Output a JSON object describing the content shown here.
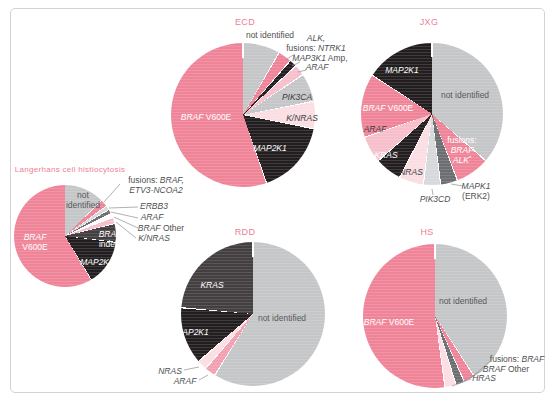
{
  "figure": {
    "background": "#ffffff",
    "frame_color": "#d2d3d5"
  },
  "palette": {
    "pink": "#ef8499",
    "black": "#221e1f",
    "charcoal": "#433e3f",
    "midgray": "#6d6e71",
    "gray": "#c5c6c8",
    "lightgray": "#d7d8da",
    "lightpink": "#f2a0b2",
    "softpink": "#f6bfcb",
    "palepink": "#fadee4",
    "white": "#fcfbfb"
  },
  "chart_data": [
    {
      "id": "lch",
      "type": "pie",
      "title": "Langerhans cell histiocytosis",
      "cx": 65,
      "cy": 236,
      "r": 51,
      "slices": [
        {
          "name": "not identified",
          "deg": 46,
          "pct": 12.8,
          "color": "gray",
          "label": {
            "placement": "inside",
            "x": 83,
            "y": 200,
            "color": "#58595b",
            "lines": [
              [
                {
                  "t": "not",
                  "i": false
                }
              ],
              [
                {
                  "t": "identified",
                  "i": false
                }
              ]
            ]
          }
        },
        {
          "name": "fusions: BRAF, ETV3-NCOA2",
          "deg": 8,
          "pct": 2.2,
          "color": "pink",
          "label": {
            "placement": "outside",
            "x": 156,
            "y": 185,
            "color": "#4f5052",
            "lines": [
              [
                {
                  "t": "fusions: ",
                  "i": false
                },
                {
                  "t": "BRAF,",
                  "i": true
                }
              ],
              [
                {
                  "t": "ETV3-NCOA2",
                  "i": true
                }
              ]
            ]
          }
        },
        {
          "name": "ERBB3",
          "deg": 5,
          "pct": 1.4,
          "color": "lightgray",
          "label": {
            "placement": "outside",
            "x": 154,
            "y": 206,
            "color": "#4f5052",
            "lines": [
              [
                {
                  "t": "ERBB3",
                  "i": true
                }
              ]
            ]
          }
        },
        {
          "name": "ARAF",
          "deg": 5,
          "pct": 1.4,
          "color": "midgray",
          "label": {
            "placement": "outside",
            "x": 152,
            "y": 217,
            "color": "#4f5052",
            "lines": [
              [
                {
                  "t": "ARAF",
                  "i": true
                }
              ]
            ]
          }
        },
        {
          "name": "BRAF Other",
          "deg": 5,
          "pct": 1.4,
          "color": "white",
          "label": {
            "placement": "outside",
            "x": 161,
            "y": 228,
            "color": "#4f5052",
            "lines": [
              [
                {
                  "t": "BRAF",
                  "i": true
                },
                {
                  "t": " Other",
                  "i": false
                }
              ]
            ]
          }
        },
        {
          "name": "K/NRAS",
          "deg": 7,
          "pct": 1.9,
          "color": "softpink",
          "label": {
            "placement": "outside",
            "x": 154,
            "y": 238,
            "color": "#4f5052",
            "lines": [
              [
                {
                  "t": "K/NRAS",
                  "i": true
                }
              ]
            ]
          }
        },
        {
          "name": "BRAF indels",
          "deg": 21,
          "pct": 5.8,
          "color": "charcoal",
          "label": {
            "placement": "inside",
            "x": 110,
            "y": 239,
            "color": "#ffffff",
            "lines": [
              [
                {
                  "t": "BRAF",
                  "i": true
                }
              ],
              [
                {
                  "t": "indels",
                  "i": false
                }
              ]
            ]
          }
        },
        {
          "name": "MAP2K1",
          "deg": 52,
          "pct": 14.4,
          "color": "black",
          "label": {
            "placement": "inside",
            "x": 97,
            "y": 262,
            "color": "#ffffff",
            "lines": [
              [
                {
                  "t": "MAP2K1",
                  "i": true
                }
              ]
            ]
          }
        },
        {
          "name": "BRAF V600E",
          "deg": 211,
          "pct": 58.6,
          "color": "pink",
          "label": {
            "placement": "inside",
            "x": 35,
            "y": 242,
            "color": "#ffffff",
            "lines": [
              [
                {
                  "t": "BRAF",
                  "i": true
                }
              ],
              [
                {
                  "t": "V600E",
                  "i": false
                }
              ]
            ]
          }
        }
      ]
    },
    {
      "id": "ecd",
      "type": "pie",
      "title": "ECD",
      "cx": 243,
      "cy": 115,
      "r": 72,
      "slices": [
        {
          "name": "not identified",
          "deg": 30,
          "pct": 8.3,
          "color": "gray",
          "label": {
            "placement": "outside",
            "x": 270,
            "y": 35,
            "color": "#4f5052",
            "lines": [
              [
                {
                  "t": "not identified",
                  "i": false
                }
              ]
            ]
          }
        },
        {
          "name": "fusions: ALK, NTRK1",
          "deg": 11,
          "pct": 3.1,
          "color": "pink",
          "label": {
            "placement": "outside",
            "x": 316,
            "y": 43,
            "color": "#4f5052",
            "lines": [
              [
                {
                  "t": "ALK,",
                  "i": true
                }
              ],
              [
                {
                  "t": "fusions: ",
                  "i": false
                },
                {
                  "t": "NTRK1",
                  "i": true
                }
              ]
            ]
          }
        },
        {
          "name": "MAP3K1 Amp",
          "deg": 6,
          "pct": 1.7,
          "color": "black",
          "label": {
            "placement": "outside",
            "x": 320,
            "y": 58,
            "color": "#4f5052",
            "lines": [
              [
                {
                  "t": "MAP3K1",
                  "i": true
                },
                {
                  "t": " Amp,",
                  "i": false
                }
              ]
            ]
          }
        },
        {
          "name": "ARAF",
          "deg": 9,
          "pct": 2.5,
          "color": "softpink",
          "label": {
            "placement": "outside",
            "x": 317,
            "y": 67,
            "color": "#4f5052",
            "lines": [
              [
                {
                  "t": "ARAF",
                  "i": true
                }
              ]
            ]
          }
        },
        {
          "name": "PIK3CA",
          "deg": 23,
          "pct": 6.4,
          "color": "gray",
          "label": {
            "placement": "inside",
            "x": 297,
            "y": 97,
            "color": "#414042",
            "lines": [
              [
                {
                  "t": "PIK3CA",
                  "i": true
                }
              ]
            ]
          }
        },
        {
          "name": "K/NRAS",
          "deg": 22,
          "pct": 6.1,
          "color": "palepink",
          "label": {
            "placement": "inside",
            "x": 302,
            "y": 118,
            "color": "#414042",
            "lines": [
              [
                {
                  "t": "K/NRAS",
                  "i": true
                }
              ]
            ]
          }
        },
        {
          "name": "MAP2K1",
          "deg": 60,
          "pct": 16.7,
          "color": "black",
          "label": {
            "placement": "inside",
            "x": 270,
            "y": 148,
            "color": "#ffffff",
            "lines": [
              [
                {
                  "t": "MAP2K1",
                  "i": true
                }
              ]
            ]
          }
        },
        {
          "name": "BRAF V600E",
          "deg": 199,
          "pct": 55.3,
          "color": "pink",
          "label": {
            "placement": "inside",
            "x": 206,
            "y": 117,
            "color": "#ffffff",
            "lines": [
              [
                {
                  "t": "BRAF",
                  "i": true
                },
                {
                  "t": " V600E",
                  "i": false
                }
              ]
            ]
          }
        }
      ]
    },
    {
      "id": "jxg",
      "type": "pie",
      "title": "JXG",
      "cx": 432,
      "cy": 114,
      "r": 71,
      "slices": [
        {
          "name": "not identified",
          "deg": 131,
          "pct": 36.4,
          "color": "gray",
          "label": {
            "placement": "inside",
            "x": 465,
            "y": 95,
            "color": "#58595b",
            "lines": [
              [
                {
                  "t": "not identified",
                  "i": false
                }
              ]
            ]
          }
        },
        {
          "name": "fusions: BRAF, ALK*",
          "deg": 28,
          "pct": 7.8,
          "color": "pink",
          "label": {
            "placement": "inside",
            "x": 462,
            "y": 150,
            "color": "#ffffff",
            "lines": [
              [
                {
                  "t": "fusions:",
                  "i": false
                }
              ],
              [
                {
                  "t": "BRAF",
                  "i": true
                }
              ],
              [
                {
                  "t": "ALK",
                  "i": true
                },
                {
                  "t": "*",
                  "i": true,
                  "sup": true
                }
              ]
            ]
          }
        },
        {
          "name": "MAPK1 (ERK2)",
          "deg": 14,
          "pct": 3.9,
          "color": "midgray",
          "label": {
            "placement": "outside",
            "x": 476,
            "y": 191,
            "color": "#4f5052",
            "lines": [
              [
                {
                  "t": "MAPK1",
                  "i": true
                }
              ],
              [
                {
                  "t": "(ERK2)",
                  "i": false
                }
              ]
            ]
          }
        },
        {
          "name": "PIK3CD",
          "deg": 14,
          "pct": 3.9,
          "color": "lightgray",
          "label": {
            "placement": "outside",
            "x": 435,
            "y": 199,
            "color": "#4f5052",
            "lines": [
              [
                {
                  "t": "PIK3CD",
                  "i": true
                }
              ]
            ]
          }
        },
        {
          "name": "NRAS",
          "deg": 20,
          "pct": 5.6,
          "color": "palepink",
          "label": {
            "placement": "inside",
            "x": 411,
            "y": 172,
            "color": "#414042",
            "lines": [
              [
                {
                  "t": "NRAS",
                  "i": true
                }
              ]
            ]
          }
        },
        {
          "name": "KRAS",
          "deg": 22,
          "pct": 6.1,
          "color": "black",
          "label": {
            "placement": "inside",
            "x": 386,
            "y": 155,
            "color": "#ffffff",
            "lines": [
              [
                {
                  "t": "KRAS",
                  "i": true
                }
              ]
            ]
          }
        },
        {
          "name": "ARAF",
          "deg": 22,
          "pct": 6.1,
          "color": "softpink",
          "label": {
            "placement": "inside",
            "x": 375,
            "y": 129,
            "color": "#414042",
            "lines": [
              [
                {
                  "t": "ARAF",
                  "i": true
                }
              ]
            ]
          }
        },
        {
          "name": "BRAF V600E",
          "deg": 52,
          "pct": 14.4,
          "color": "pink",
          "label": {
            "placement": "inside",
            "x": 388,
            "y": 108,
            "color": "#ffffff",
            "lines": [
              [
                {
                  "t": "BRAF",
                  "i": true
                },
                {
                  "t": " V600E",
                  "i": false
                }
              ]
            ]
          }
        },
        {
          "name": "MAP2K1",
          "deg": 57,
          "pct": 15.8,
          "color": "black",
          "label": {
            "placement": "inside",
            "x": 402,
            "y": 70,
            "color": "#ffffff",
            "lines": [
              [
                {
                  "t": "MAP2K1",
                  "i": true
                }
              ]
            ]
          }
        }
      ]
    },
    {
      "id": "rdd",
      "type": "pie",
      "title": "RDD",
      "cx": 253,
      "cy": 314,
      "r": 72,
      "slices": [
        {
          "name": "not identified",
          "deg": 212,
          "pct": 58.9,
          "color": "gray",
          "label": {
            "placement": "inside",
            "x": 282,
            "y": 318,
            "color": "#58595b",
            "lines": [
              [
                {
                  "t": "not identified",
                  "i": false
                }
              ]
            ]
          }
        },
        {
          "name": "ARAF",
          "deg": 9,
          "pct": 2.5,
          "color": "lightpink",
          "label": {
            "placement": "outside",
            "x": 185,
            "y": 381,
            "color": "#4f5052",
            "lines": [
              [
                {
                  "t": "ARAF",
                  "i": true
                }
              ]
            ]
          }
        },
        {
          "name": "NRAS",
          "deg": 8,
          "pct": 2.2,
          "color": "palepink",
          "label": {
            "placement": "outside",
            "x": 170,
            "y": 371,
            "color": "#4f5052",
            "lines": [
              [
                {
                  "t": "NRAS",
                  "i": true
                }
              ]
            ]
          }
        },
        {
          "name": "MAP2K1",
          "deg": 46,
          "pct": 12.8,
          "color": "black",
          "label": {
            "placement": "inside",
            "x": 192,
            "y": 332,
            "color": "#ffffff",
            "lines": [
              [
                {
                  "t": "MAP2K1",
                  "i": true
                }
              ]
            ]
          }
        },
        {
          "name": "KRAS",
          "deg": 85,
          "pct": 23.6,
          "color": "charcoal",
          "label": {
            "placement": "inside",
            "x": 212,
            "y": 285,
            "color": "#ffffff",
            "lines": [
              [
                {
                  "t": "KRAS",
                  "i": true
                }
              ]
            ]
          }
        }
      ]
    },
    {
      "id": "hs",
      "type": "pie",
      "title": "HS",
      "cx": 435,
      "cy": 316,
      "r": 72,
      "slices": [
        {
          "name": "not identified",
          "deg": 147,
          "pct": 40.8,
          "color": "gray",
          "label": {
            "placement": "inside",
            "x": 463,
            "y": 301,
            "color": "#58595b",
            "lines": [
              [
                {
                  "t": "not identified",
                  "i": false
                }
              ]
            ]
          }
        },
        {
          "name": "fusions: BRAF",
          "deg": 9,
          "pct": 2.5,
          "color": "pink",
          "label": {
            "placement": "outside",
            "x": 517,
            "y": 359,
            "color": "#4f5052",
            "lines": [
              [
                {
                  "t": "fusions: ",
                  "i": false
                },
                {
                  "t": "BRAF",
                  "i": true
                }
              ]
            ]
          }
        },
        {
          "name": "BRAF Other",
          "deg": 7,
          "pct": 1.9,
          "color": "midgray",
          "label": {
            "placement": "outside",
            "x": 506,
            "y": 369,
            "color": "#4f5052",
            "lines": [
              [
                {
                  "t": "BRAF",
                  "i": true
                },
                {
                  "t": " Other",
                  "i": false
                }
              ]
            ]
          }
        },
        {
          "name": "HRAS",
          "deg": 9,
          "pct": 2.5,
          "color": "palepink",
          "label": {
            "placement": "outside",
            "x": 484,
            "y": 378,
            "color": "#4f5052",
            "lines": [
              [
                {
                  "t": "HRAS",
                  "i": true
                }
              ]
            ]
          }
        },
        {
          "name": "BRAF V600E",
          "deg": 188,
          "pct": 52.2,
          "color": "pink",
          "label": {
            "placement": "inside",
            "x": 389,
            "y": 322,
            "color": "#ffffff",
            "lines": [
              [
                {
                  "t": "BRAF",
                  "i": true
                },
                {
                  "t": " V600E",
                  "i": false
                }
              ]
            ]
          }
        }
      ]
    }
  ]
}
